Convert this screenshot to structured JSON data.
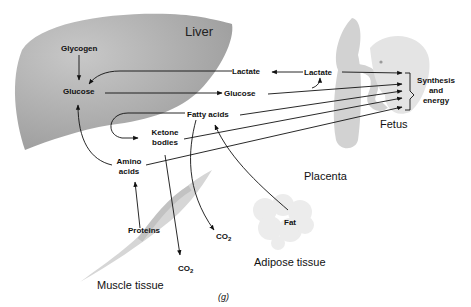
{
  "diagram": {
    "panel_label": "(g)",
    "organs": {
      "liver": "Liver",
      "placenta": "Placenta",
      "fetus": "Fetus",
      "muscle": "Muscle tissue",
      "adipose": "Adipose tissue"
    },
    "nodes": {
      "glycogen": "Glycogen",
      "glucose_liver": "Glucose",
      "lactate_mid": "Lactate",
      "glucose_mid": "Glucose",
      "fatty_acids": "Fatty acids",
      "ketone_1": "Ketone",
      "ketone_2": "bodies",
      "amino_1": "Amino",
      "amino_2": "acids",
      "proteins": "Proteins",
      "fat": "Fat",
      "lactate_placenta": "Lactate",
      "synthesis_1": "Synthesis",
      "synthesis_2": "and",
      "synthesis_3": "energy",
      "co2_a": "CO",
      "co2_a_sub": "2",
      "co2_b": "CO",
      "co2_b_sub": "2"
    },
    "colors": {
      "liver_fill": "#a9a9a9",
      "placenta_fill": "#d4d4d4",
      "fetus_fill": "#e6e6e6",
      "muscle_fill": "#d8d8d8",
      "adipose_fill": "#ececec",
      "arrow": "#111111"
    }
  }
}
